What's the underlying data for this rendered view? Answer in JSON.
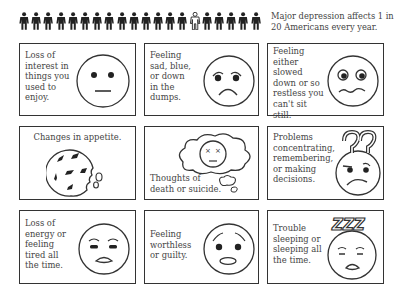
{
  "header": {
    "people_count": 20,
    "highlighted_index": 14,
    "headline": "Major depression affects 1 in 20 Americans every year."
  },
  "cards": [
    {
      "id": "loss-of-interest",
      "text": "Loss of interest in things you used to enjoy.",
      "icon": "neutral-face-icon"
    },
    {
      "id": "sad",
      "text": "Feeling sad, blue, or down in the dumps.",
      "icon": "sad-face-icon"
    },
    {
      "id": "slowed-restless",
      "text": "Feeling either slowed down or so restless you can't sit still.",
      "icon": "wide-eyed-face-icon"
    },
    {
      "id": "appetite",
      "text": "Changes in appetite.",
      "icon": "cookie-icon"
    },
    {
      "id": "death-thoughts",
      "text": "Thoughts of death or suicide.",
      "icon": "thought-cloud-icon"
    },
    {
      "id": "concentrating",
      "text": "Problems concentrating, remembering, or making decisions.",
      "icon": "confused-face-icon"
    },
    {
      "id": "energy",
      "text": "Loss of energy or feeling tired all the time.",
      "icon": "tired-face-icon"
    },
    {
      "id": "worthless",
      "text": "Feeling worthless or guilty.",
      "icon": "worried-face-icon"
    },
    {
      "id": "sleep",
      "text": "Trouble sleeping or sleeping all the time.",
      "icon": "sleeping-face-icon"
    }
  ],
  "colors": {
    "line": "#333333",
    "text": "#444444",
    "background": "#ffffff"
  }
}
